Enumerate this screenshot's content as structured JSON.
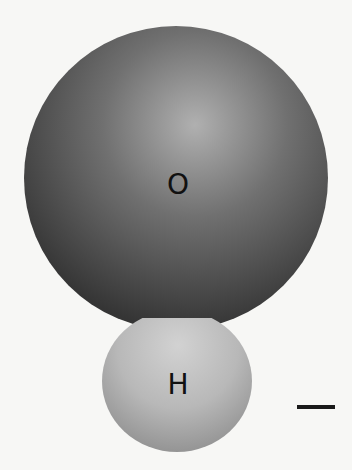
{
  "diagram": {
    "atoms": [
      {
        "label": "O",
        "role": "oxygen-atom",
        "cx": 176,
        "cy": 178,
        "r": 152,
        "highlight": {
          "cx": 195,
          "cy": 125
        },
        "colors": {
          "light": "#b0b0b0",
          "mid": "#707070",
          "dark": "#3a3a3a"
        },
        "label_pos": {
          "x": 178,
          "y": 185
        }
      },
      {
        "label": "H",
        "role": "hydrogen-atom",
        "cx": 177,
        "cy": 380,
        "r": 74,
        "highlight": {
          "cx": 178,
          "cy": 345
        },
        "colors": {
          "light": "#d0d0d0",
          "mid": "#b4b4b4",
          "dark": "#929292"
        },
        "label_pos": {
          "x": 178,
          "y": 385
        }
      }
    ],
    "scale_bar": {
      "x": 297,
      "y": 405,
      "width": 38,
      "height": 4,
      "color": "#1a1a1a"
    },
    "background": "#f7f7f5"
  }
}
